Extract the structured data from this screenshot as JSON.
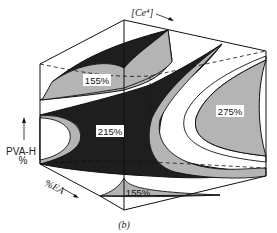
{
  "figure": {
    "panel_label": "(b)",
    "axes": {
      "top_axis_label": "[Ce⁴]",
      "vertical_axis_label_line1": "PVA-H",
      "vertical_axis_label_line2": "%",
      "depth_axis_label": "%EA"
    },
    "regions": [
      {
        "label": "155%",
        "position": "upper-left"
      },
      {
        "label": "215%",
        "position": "center"
      },
      {
        "label": "275%",
        "position": "right"
      },
      {
        "label": "155%",
        "position": "bottom"
      }
    ],
    "colors": {
      "dark_surface": "#1e1e1e",
      "gray_surface": "#b4b4b4",
      "background": "#ffffff",
      "line": "#111111"
    }
  }
}
